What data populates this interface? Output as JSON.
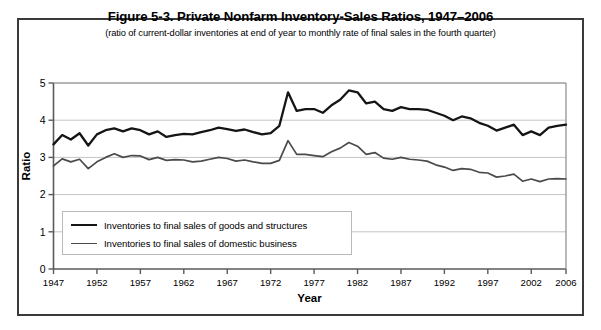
{
  "figure": {
    "title": "Figure 5-3. Private Nonfarm Inventory-Sales Ratios, 1947–2006",
    "subtitle": "(ratio of current-dollar inventories  at end of year to monthly rate of final sales in the fourth quarter)"
  },
  "axis": {
    "x_title": "Year",
    "y_title": "Ratio"
  },
  "legend": {
    "items": [
      {
        "label": "Inventories to final sales of goods and structures",
        "color": "#151515"
      },
      {
        "label": "Inventories to final sales of domestic business",
        "color": "#4a4a4a"
      }
    ]
  },
  "chart_data": {
    "type": "line",
    "title": "Figure 5-3. Private Nonfarm Inventory-Sales Ratios, 1947–2006",
    "subtitle": "(ratio of current-dollar inventories  at end of year to monthly rate of final sales in the fourth quarter)",
    "xlabel": "Year",
    "ylabel": "Ratio",
    "xlim": [
      1947,
      2006
    ],
    "ylim": [
      0,
      5
    ],
    "yticks": [
      0,
      1,
      2,
      3,
      4,
      5
    ],
    "ytick_labels": [
      "0",
      "1",
      "2",
      "3",
      "4",
      "5"
    ],
    "xticks": [
      1947,
      1952,
      1957,
      1962,
      1967,
      1972,
      1977,
      1982,
      1987,
      1992,
      1997,
      2002,
      2006
    ],
    "xtick_labels": [
      "1947",
      "1952",
      "1957",
      "1962",
      "1967",
      "1972",
      "1977",
      "1982",
      "1987",
      "1992",
      "1997",
      "2002",
      "2006"
    ],
    "grid": "horizontal",
    "legend_position": "inside-lower-left",
    "x": [
      1947,
      1948,
      1949,
      1950,
      1951,
      1952,
      1953,
      1954,
      1955,
      1956,
      1957,
      1958,
      1959,
      1960,
      1961,
      1962,
      1963,
      1964,
      1965,
      1966,
      1967,
      1968,
      1969,
      1970,
      1971,
      1972,
      1973,
      1974,
      1975,
      1976,
      1977,
      1978,
      1979,
      1980,
      1981,
      1982,
      1983,
      1984,
      1985,
      1986,
      1987,
      1988,
      1989,
      1990,
      1991,
      1992,
      1993,
      1994,
      1995,
      1996,
      1997,
      1998,
      1999,
      2000,
      2001,
      2002,
      2003,
      2004,
      2005,
      2006
    ],
    "series": [
      {
        "name": "Inventories to final sales of goods and structures",
        "color": "#151515",
        "values": [
          3.35,
          3.6,
          3.48,
          3.65,
          3.32,
          3.62,
          3.73,
          3.78,
          3.7,
          3.78,
          3.73,
          3.62,
          3.7,
          3.55,
          3.6,
          3.63,
          3.62,
          3.68,
          3.73,
          3.8,
          3.76,
          3.71,
          3.75,
          3.68,
          3.62,
          3.65,
          3.85,
          4.75,
          4.25,
          4.3,
          4.3,
          4.2,
          4.4,
          4.55,
          4.8,
          4.75,
          4.45,
          4.5,
          4.3,
          4.25,
          4.35,
          4.3,
          4.3,
          4.28,
          4.2,
          4.12,
          4.0,
          4.1,
          4.05,
          3.93,
          3.85,
          3.72,
          3.8,
          3.88,
          3.6,
          3.7,
          3.6,
          3.8,
          3.85,
          3.88
        ]
      },
      {
        "name": "Inventories to final sales of domestic business",
        "color": "#4a4a4a",
        "values": [
          2.77,
          2.96,
          2.88,
          2.95,
          2.7,
          2.88,
          3.0,
          3.1,
          3.0,
          3.05,
          3.04,
          2.94,
          3.0,
          2.92,
          2.94,
          2.93,
          2.88,
          2.9,
          2.95,
          3.0,
          2.97,
          2.9,
          2.93,
          2.88,
          2.84,
          2.84,
          2.92,
          3.45,
          3.08,
          3.08,
          3.05,
          3.02,
          3.15,
          3.25,
          3.4,
          3.3,
          3.08,
          3.13,
          2.98,
          2.95,
          3.0,
          2.95,
          2.93,
          2.9,
          2.8,
          2.74,
          2.65,
          2.7,
          2.68,
          2.6,
          2.58,
          2.47,
          2.5,
          2.55,
          2.36,
          2.42,
          2.35,
          2.42,
          2.43,
          2.42
        ]
      }
    ]
  }
}
